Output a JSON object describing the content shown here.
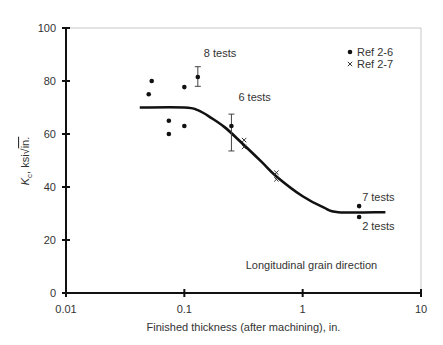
{
  "chart_data": {
    "type": "scatter",
    "title": "",
    "xlabel": "Finished thickness (after machining), in.",
    "ylabel": "Kc, ksi√in.",
    "ylabel_parts": {
      "symbol": "K",
      "subscript": "c",
      "rest": ", ksi",
      "root": "in."
    },
    "xscale": "log",
    "xlim": [
      0.01,
      10
    ],
    "ylim": [
      0,
      100
    ],
    "xticks": [
      0.01,
      0.1,
      1,
      10
    ],
    "xtick_labels": [
      "0.01",
      "0.1",
      "1",
      "10"
    ],
    "yticks": [
      0,
      20,
      40,
      60,
      80,
      100
    ],
    "ytick_labels": [
      "0",
      "20",
      "40",
      "60",
      "80",
      "100"
    ],
    "grid": false,
    "legend": {
      "position": "upper right",
      "entries": [
        {
          "label": "Ref 2-6",
          "marker": "dot"
        },
        {
          "label": "Ref 2-7",
          "marker": "x"
        }
      ]
    },
    "series": [
      {
        "name": "Ref 2-6",
        "marker": "dot",
        "points": [
          {
            "x": 0.05,
            "y": 75
          },
          {
            "x": 0.053,
            "y": 80
          },
          {
            "x": 0.074,
            "y": 65
          },
          {
            "x": 0.074,
            "y": 60
          },
          {
            "x": 0.1,
            "y": 77.7
          },
          {
            "x": 0.1,
            "y": 63
          },
          {
            "x": 0.13,
            "y": 81.5,
            "err_low": 78,
            "err_high": 85.4
          },
          {
            "x": 0.25,
            "y": 63,
            "err_low": 53.6,
            "err_high": 67.5
          },
          {
            "x": 3.0,
            "y": 32.8
          },
          {
            "x": 3.0,
            "y": 28.7
          }
        ]
      },
      {
        "name": "Ref 2-7",
        "marker": "x",
        "points": [
          {
            "x": 0.32,
            "y": 57.7
          },
          {
            "x": 0.32,
            "y": 55.1
          },
          {
            "x": 0.6,
            "y": 45.4
          },
          {
            "x": 0.6,
            "y": 42.9
          }
        ]
      },
      {
        "name": "Trend curve",
        "type": "line",
        "points": [
          {
            "x": 0.042,
            "y": 70
          },
          {
            "x": 0.1,
            "y": 70
          },
          {
            "x": 0.13,
            "y": 69
          },
          {
            "x": 0.17,
            "y": 66
          },
          {
            "x": 0.22,
            "y": 62.5
          },
          {
            "x": 0.3,
            "y": 57
          },
          {
            "x": 0.45,
            "y": 49.5
          },
          {
            "x": 0.6,
            "y": 44
          },
          {
            "x": 1.0,
            "y": 36.5
          },
          {
            "x": 1.5,
            "y": 32.3
          },
          {
            "x": 2.0,
            "y": 30.5
          },
          {
            "x": 5.0,
            "y": 30.5
          }
        ]
      }
    ],
    "annotations": [
      {
        "text": "8 tests",
        "x": 0.13,
        "y": 85.4
      },
      {
        "text": "6 tests",
        "x": 0.25,
        "y": 67.5
      },
      {
        "text": "7 tests",
        "x": 3.0,
        "y": 32.8
      },
      {
        "text": "2 tests",
        "x": 3.0,
        "y": 28.7
      },
      {
        "text": "Longitudinal grain direction",
        "x": 1.0,
        "y": 10
      }
    ]
  }
}
